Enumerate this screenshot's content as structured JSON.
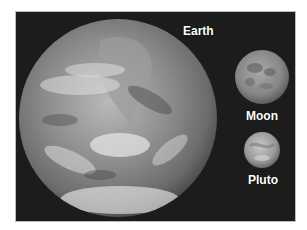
{
  "image": {
    "background_color": "#1c1c1c",
    "bodies": [
      {
        "name": "Earth",
        "label": "Earth",
        "cx": 118,
        "cy": 118,
        "r": 99
      },
      {
        "name": "Moon",
        "label": "Moon",
        "cx": 262,
        "cy": 77,
        "r": 27
      },
      {
        "name": "Pluto",
        "label": "Pluto",
        "cx": 262,
        "cy": 150,
        "r": 18
      }
    ]
  }
}
